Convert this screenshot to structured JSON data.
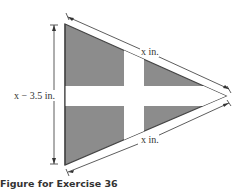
{
  "figure": {
    "labels": {
      "left_side": "x − 3.5 in.",
      "top_side": "x in.",
      "bottom_side": "x in."
    },
    "caption": "Figure for Exercise 36",
    "colors": {
      "fill": "#8c8c8c",
      "cross": "#ffffff",
      "edge": "#444444",
      "dimension_line": "#333333"
    }
  }
}
